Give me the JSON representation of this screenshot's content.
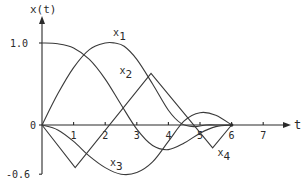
{
  "chart_data": {
    "type": "line",
    "title": "",
    "xlabel": "t",
    "ylabel": "x(t)",
    "xlim": [
      0,
      7.5
    ],
    "ylim": [
      -0.6,
      1.15
    ],
    "grid": false,
    "legend": "inline labels on curves",
    "x_ticks": [
      "1",
      "2",
      "3",
      "4",
      "5",
      "6",
      "7"
    ],
    "y_ticks": [
      "1.0",
      "0",
      "-0.6"
    ],
    "series": [
      {
        "name": "x1",
        "label_pos": [
          2.25,
          1.08
        ],
        "x": [
          0,
          0.5,
          1,
          1.5,
          2,
          2.3,
          2.6,
          3,
          3.5,
          4,
          4.4,
          4.8,
          5.2,
          5.6,
          6
        ],
        "y": [
          0,
          0.38,
          0.7,
          0.92,
          1.0,
          1.0,
          0.96,
          0.8,
          0.5,
          0.18,
          0.02,
          -0.02,
          0.0,
          0.0,
          0
        ]
      },
      {
        "name": "x2",
        "label_pos": [
          2.45,
          0.62
        ],
        "x": [
          0,
          0.5,
          1,
          1.5,
          2,
          2.5,
          3,
          3.5,
          4,
          4.5,
          5,
          5.5,
          6
        ],
        "y": [
          1.0,
          0.99,
          0.94,
          0.8,
          0.56,
          0.25,
          -0.05,
          -0.25,
          -0.3,
          -0.22,
          -0.1,
          -0.02,
          0
        ]
      },
      {
        "name": "x3",
        "label_pos": [
          2.15,
          -0.5
        ],
        "x": [
          0,
          0.5,
          1,
          1.5,
          2,
          2.5,
          3,
          3.5,
          4,
          4.5,
          5,
          5.5,
          6
        ],
        "y": [
          0,
          -0.06,
          -0.2,
          -0.38,
          -0.52,
          -0.6,
          -0.58,
          -0.45,
          -0.2,
          0.05,
          0.15,
          0.12,
          0
        ]
      },
      {
        "name": "x4",
        "label_pos": [
          5.55,
          -0.38
        ],
        "x": [
          0,
          1.05,
          3.45,
          5.4,
          6
        ],
        "y": [
          0,
          -0.52,
          0.63,
          -0.28,
          0
        ]
      }
    ]
  },
  "labels": {
    "y_axis": "x(t)",
    "x_axis": "t",
    "y_tick_top": "1.0",
    "y_tick_zero": "0",
    "y_tick_bottom": "-0.6"
  }
}
